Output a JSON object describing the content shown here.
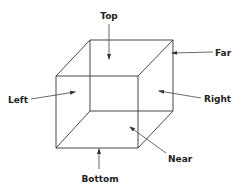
{
  "diagram": {
    "labels": {
      "top": "Top",
      "far": "Far",
      "left": "Left",
      "right": "Right",
      "near": "Near",
      "bottom": "Bottom"
    },
    "colors": {
      "line": "#333333",
      "text": "#222222",
      "background": "#ffffff"
    }
  }
}
